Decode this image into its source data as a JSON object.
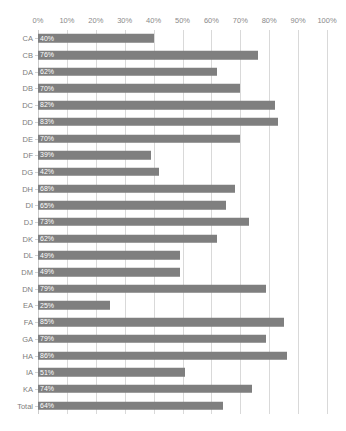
{
  "chart_data": {
    "type": "bar",
    "orientation": "horizontal",
    "title": "",
    "xlabel": "",
    "ylabel": "",
    "xlim": [
      0,
      100
    ],
    "grid": true,
    "legend": "none",
    "value_suffix": "%",
    "bar_color": "#7f7f7f",
    "gridline_color": "#d9d9d9",
    "label_color": "#7d7d7d",
    "axis_tick_labels": [
      "0%",
      "10%",
      "20%",
      "30%",
      "40%",
      "50%",
      "60%",
      "70%",
      "80%",
      "90%",
      "100%"
    ],
    "axis_tick_values": [
      0,
      10,
      20,
      30,
      40,
      50,
      60,
      70,
      80,
      90,
      100
    ],
    "categories": [
      "CA",
      "CB",
      "DA",
      "DB",
      "DC",
      "DD",
      "DE",
      "DF",
      "DG",
      "DH",
      "DI",
      "DJ",
      "DK",
      "DL",
      "DM",
      "DN",
      "EA",
      "FA",
      "GA",
      "HA",
      "IA",
      "KA",
      "Total"
    ],
    "values": [
      40,
      76,
      62,
      70,
      82,
      83,
      70,
      39,
      42,
      68,
      65,
      73,
      62,
      49,
      49,
      79,
      25,
      85,
      79,
      86,
      51,
      74,
      64
    ],
    "data_labels": [
      "40%",
      "76%",
      "62%",
      "70%",
      "82%",
      "83%",
      "70%",
      "39%",
      "42%",
      "68%",
      "65%",
      "73%",
      "62%",
      "49%",
      "49%",
      "79%",
      "25%",
      "85%",
      "79%",
      "86%",
      "51%",
      "74%",
      "64%"
    ]
  }
}
